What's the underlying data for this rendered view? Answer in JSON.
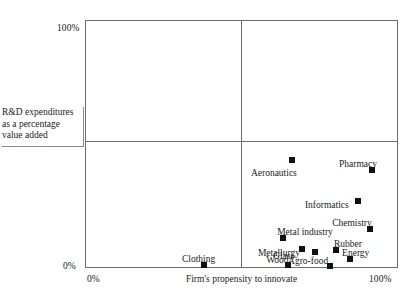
{
  "chart_data": {
    "type": "scatter",
    "title": "",
    "xlabel": "Firm's propensity to innovate",
    "ylabel": "R&D expenditures as a percentage value added",
    "xlim": [
      0,
      100
    ],
    "ylim": [
      0,
      100
    ],
    "xticks": [
      "0%",
      "100%"
    ],
    "yticks": [
      "0%",
      "100%"
    ],
    "grid": false,
    "legend": "none",
    "quadrant_lines": {
      "vertical_x": 50,
      "horizontal_y": 50
    },
    "points": [
      {
        "label": "Aeronautics",
        "x": 66.1,
        "y": 43.5,
        "label_dx": -41,
        "label_dy": 8
      },
      {
        "label": "Pharmacy",
        "x": 91.7,
        "y": 39.5,
        "label_dx": -33,
        "label_dy": -11
      },
      {
        "label": "Informatics",
        "x": 87.2,
        "y": 27.0,
        "label_dx": -53,
        "label_dy": -1
      },
      {
        "label": "Chemistry",
        "x": 91.1,
        "y": 15.7,
        "label_dx": -38,
        "label_dy": -11
      },
      {
        "label": "Metal industry",
        "x": 63.3,
        "y": 12.1,
        "label_dx": -6,
        "label_dy": -11
      },
      {
        "label": "Metallurgy",
        "x": 69.3,
        "y": 7.7,
        "label_dx": -44,
        "label_dy": -1
      },
      {
        "label": "Rubber",
        "x": 80.2,
        "y": 7.3,
        "label_dx": -2,
        "label_dy": -11
      },
      {
        "label": "Glass",
        "x": 73.5,
        "y": 6.5,
        "label_dx": -42,
        "label_dy": -1
      },
      {
        "label": "Energy",
        "x": 84.7,
        "y": 3.6,
        "label_dx": -8,
        "label_dy": -11
      },
      {
        "label": "Agro-food",
        "x": 78.3,
        "y": 0.8,
        "label_dx": -42,
        "label_dy": -10
      },
      {
        "label": "Wood",
        "x": 64.9,
        "y": 1.2,
        "label_dx": -22,
        "label_dy": -10
      },
      {
        "label": "Clothing",
        "x": 38.0,
        "y": 1.2,
        "label_dx": -22,
        "label_dy": -11
      }
    ]
  },
  "axes": {
    "y_top_tick": "100%",
    "y_bottom_tick": "0%",
    "x_left_tick": "0%",
    "x_right_tick": "100%",
    "x_title": "Firm's propensity to innovate",
    "y_caption": "R&D expenditures as a percentage value added"
  }
}
